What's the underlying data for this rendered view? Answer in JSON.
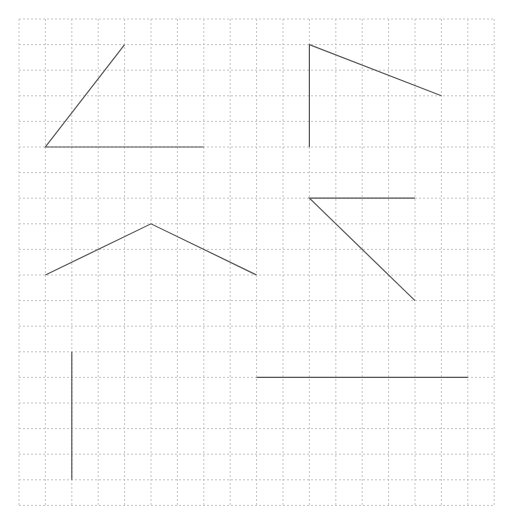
{
  "grid": {
    "origin_x": 19,
    "origin_y": 19,
    "cols": 18,
    "rows": 19,
    "cell_w": 26.4,
    "cell_h": 25.6,
    "line_color": "#c4c4c4",
    "dash": "2,2"
  },
  "stroke": {
    "color": "#555555",
    "width": 1.2
  },
  "figures": [
    {
      "name": "angle-top-left",
      "points": [
        [
          4,
          1
        ],
        [
          1,
          5
        ],
        [
          7,
          5
        ]
      ]
    },
    {
      "name": "angle-top-right",
      "points": [
        [
          16,
          3
        ],
        [
          11,
          1
        ],
        [
          11,
          5
        ]
      ]
    },
    {
      "name": "angle-middle-left",
      "points": [
        [
          1,
          10
        ],
        [
          5,
          8
        ],
        [
          9,
          10
        ]
      ]
    },
    {
      "name": "angle-middle-right",
      "points": [
        [
          15,
          7
        ],
        [
          11,
          7
        ],
        [
          15,
          11
        ]
      ]
    },
    {
      "name": "segment-bottom-left-vertical",
      "points": [
        [
          2,
          13
        ],
        [
          2,
          18
        ]
      ]
    },
    {
      "name": "segment-bottom-right-horizontal",
      "points": [
        [
          9,
          14
        ],
        [
          17,
          14
        ]
      ]
    }
  ]
}
